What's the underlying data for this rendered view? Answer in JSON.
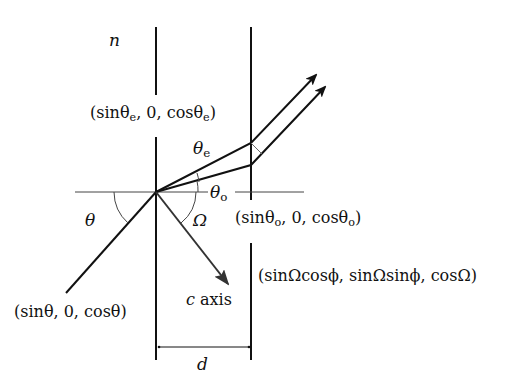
{
  "diagram": {
    "labels": {
      "n": "n",
      "theta": "θ",
      "theta_e": "θ",
      "theta_e_sub": "e",
      "theta_o": "θ",
      "theta_o_sub": "o",
      "omega": "Ω",
      "d": "d",
      "c_axis_c": "c",
      "c_axis_text": " axis"
    },
    "vectors": {
      "e_open": "(sinθ",
      "e_sub1": "e",
      "e_mid": ", 0, cosθ",
      "e_sub2": "e",
      "e_close": ")",
      "o_open": "(sinθ",
      "o_sub1": "o",
      "o_mid": ", 0, cosθ",
      "o_sub2": "o",
      "o_close": ")",
      "incident": "(sinθ, 0, cosθ)",
      "c_axis": "(sinΩcosϕ, sinΩsinϕ, cosΩ)"
    },
    "colors": {
      "stroke": "#111111",
      "arrow": "#222222",
      "thin": "#555555"
    }
  }
}
